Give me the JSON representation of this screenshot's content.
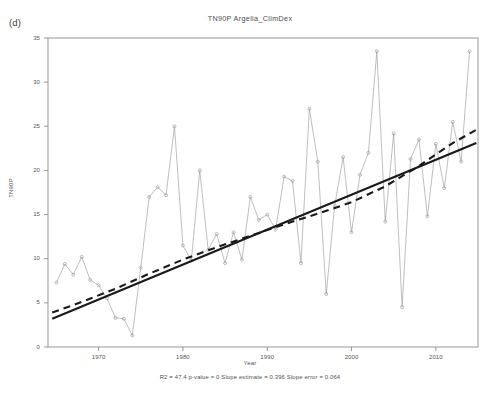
{
  "figure": {
    "panel_label": "(d)",
    "title": "TN90P  Argelia_ClimDex",
    "caption": "R2 = 47.4  p-value = 0  Slope estimate = 0.396  Slope error = 0.064",
    "background_color": "#ffffff",
    "axis_color": "#8c8c8c",
    "series_color": "#9a9a9a",
    "trend_color": "#1a1a1a"
  },
  "chart_data": {
    "type": "line",
    "title": "TN90P  Argelia_ClimDex",
    "subtitle": "",
    "xlabel": "Year",
    "ylabel": "TN90P",
    "xlim": [
      1964,
      2015
    ],
    "ylim": [
      0,
      35
    ],
    "grid": false,
    "legend": null,
    "xticks": [
      1970,
      1980,
      1990,
      2000,
      2010
    ],
    "yticks": [
      0,
      5,
      10,
      15,
      20,
      25,
      30,
      35
    ],
    "annotations": [
      "R2 = 47.4",
      "p-value = 0",
      "Slope estimate = 0.396",
      "Slope error = 0.064"
    ],
    "statistics": {
      "r_squared": 47.4,
      "p_value": 0,
      "slope_estimate": 0.396,
      "slope_error": 0.064
    },
    "series": [
      {
        "name": "TN90P annual",
        "style": "line-with-open-circle-markers",
        "x": [
          1965,
          1966,
          1967,
          1968,
          1969,
          1970,
          1971,
          1972,
          1973,
          1974,
          1975,
          1976,
          1977,
          1978,
          1979,
          1980,
          1981,
          1982,
          1983,
          1984,
          1985,
          1986,
          1987,
          1988,
          1989,
          1990,
          1991,
          1992,
          1993,
          1994,
          1995,
          1996,
          1997,
          1998,
          1999,
          2000,
          2001,
          2002,
          2003,
          2004,
          2005,
          2006,
          2007,
          2008,
          2009,
          2010,
          2011,
          2012,
          2013,
          2014
        ],
        "values": [
          7.3,
          9.4,
          8.2,
          10.2,
          7.6,
          7.0,
          5.5,
          3.3,
          3.2,
          1.3,
          9.0,
          17.0,
          18.1,
          17.2,
          25.0,
          11.5,
          9.8,
          20.0,
          11.0,
          12.8,
          9.5,
          13.0,
          9.9,
          17.0,
          14.4,
          15.0,
          13.3,
          19.3,
          18.8,
          9.5,
          27.0,
          21.0,
          6.0,
          16.0,
          21.5,
          13.0,
          19.5,
          22.0,
          33.5,
          14.2,
          24.2,
          4.5,
          21.3,
          23.5,
          14.8,
          23.0,
          18.0,
          25.5,
          21.0,
          33.5
        ]
      },
      {
        "name": "Linear trend",
        "style": "solid-thick-line",
        "x": [
          1964.5,
          2014.8
        ],
        "values": [
          3.2,
          23.1
        ]
      },
      {
        "name": "Smoothed (lowess) trend",
        "style": "dashed-thick-line",
        "x": [
          1964.5,
          1968,
          1972,
          1976,
          1980,
          1984,
          1988,
          1992,
          1996,
          2000,
          2004,
          2008,
          2012,
          2014.8
        ],
        "values": [
          3.9,
          5.1,
          6.6,
          8.3,
          9.9,
          11.3,
          12.6,
          13.9,
          15.1,
          16.4,
          18.2,
          20.5,
          23.1,
          24.6
        ]
      }
    ]
  }
}
